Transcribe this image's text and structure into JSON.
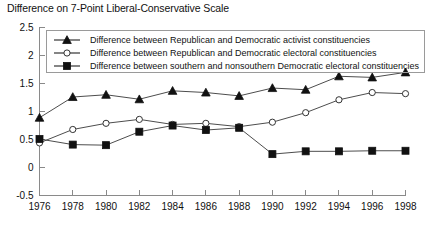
{
  "chart_data": {
    "type": "line",
    "title": "Difference on 7-Point Liberal-Conservative Scale",
    "xlabel": "",
    "ylabel": "",
    "x": [
      1976,
      1978,
      1980,
      1982,
      1984,
      1986,
      1988,
      1990,
      1992,
      1994,
      1996,
      1998
    ],
    "xtick_labels": [
      "1976",
      "1978",
      "1980",
      "1982",
      "1984",
      "1986",
      "1988",
      "1990",
      "1992",
      "1994",
      "1996",
      "1998"
    ],
    "ytick_labels": [
      "2.5",
      "2",
      "1.5",
      "1",
      "0.5",
      "0",
      "-0.5"
    ],
    "yticks": [
      2.5,
      2,
      1.5,
      1,
      0.5,
      0,
      -0.5
    ],
    "ylim": [
      -0.5,
      2.5
    ],
    "xlim": [
      1976,
      1998
    ],
    "grid": false,
    "legend_position": "top-left",
    "series": [
      {
        "name": "Difference between Republican and Democratic activist constituencies",
        "marker": "filled-triangle",
        "values": [
          0.88,
          1.25,
          1.29,
          1.21,
          1.36,
          1.33,
          1.27,
          1.41,
          1.38,
          1.62,
          1.6,
          1.69
        ]
      },
      {
        "name": "Difference between Republican and Democratic electoral constituencies",
        "marker": "open-circle",
        "values": [
          0.43,
          0.67,
          0.78,
          0.85,
          0.76,
          0.78,
          0.72,
          0.8,
          0.97,
          1.2,
          1.33,
          1.31
        ]
      },
      {
        "name": "Difference between southern and nonsouthern Democratic electoral constituencies",
        "marker": "filled-square",
        "values": [
          0.5,
          0.4,
          0.39,
          0.63,
          0.74,
          0.66,
          0.7,
          0.23,
          0.28,
          0.28,
          0.29,
          0.29
        ]
      }
    ]
  },
  "colors": {
    "line": "#4d4d4d",
    "marker": "#111111",
    "axis": "#8a8a8a",
    "text": "#111111",
    "background": "#ffffff"
  }
}
